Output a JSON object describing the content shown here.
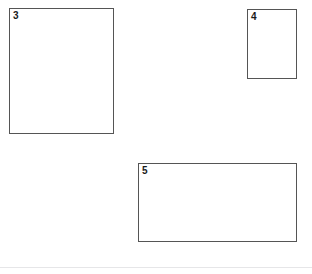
{
  "page": {
    "background_color": "#ffffff",
    "width": 312,
    "height": 274
  },
  "style": {
    "box_border_color": "#555555",
    "box_fill_color": "#ffffff",
    "label_color": "#1a1a1a",
    "rule_color": "#e6e6e8"
  },
  "regions": [
    {
      "label": "3",
      "name": "region-box-3",
      "x": 9,
      "y": 8,
      "width": 105,
      "height": 126
    },
    {
      "label": "4",
      "name": "region-box-4",
      "x": 247,
      "y": 9,
      "width": 50,
      "height": 70
    },
    {
      "label": "5",
      "name": "region-box-5",
      "x": 138,
      "y": 163,
      "width": 159,
      "height": 79
    }
  ],
  "footer": {
    "rule_y": 267,
    "rule_width": 312
  }
}
